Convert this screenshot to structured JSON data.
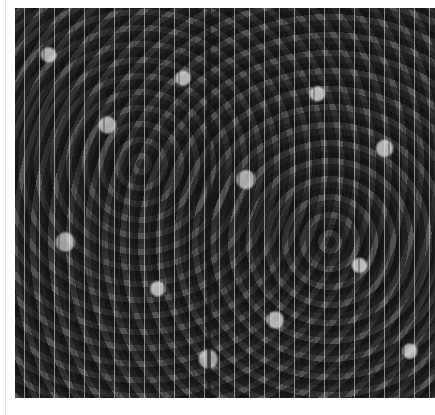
{
  "image": {
    "description": "Grayscale textured micrograph with vertical streak lines and bright blotches",
    "colors": {
      "background": "#ffffff",
      "texture_mid": "#6e6e6e",
      "streak": "#ebebeb",
      "dark_band": "#141414"
    }
  }
}
